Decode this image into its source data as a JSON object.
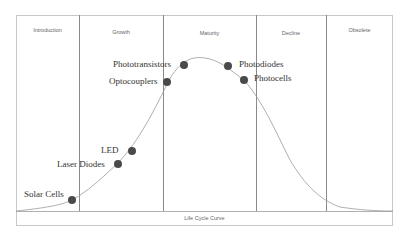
{
  "diagram": {
    "caption": "Life Cycle Curve",
    "phases": [
      {
        "label": "Introduction"
      },
      {
        "label": "Growth"
      },
      {
        "label": "Maturity"
      },
      {
        "label": "Decline"
      },
      {
        "label": "Obsolete"
      }
    ],
    "points": [
      {
        "label": "Solar Cells"
      },
      {
        "label": "Laser Diodes"
      },
      {
        "label": "LED"
      },
      {
        "label": "Optocouplers"
      },
      {
        "label": "Phototransistors"
      },
      {
        "label": "Photodiodes"
      },
      {
        "label": "Photocells"
      }
    ],
    "colors": {
      "dot": "#4a4a4a",
      "curve": "#9a9a9a",
      "lines": "#8a8a8a"
    }
  }
}
